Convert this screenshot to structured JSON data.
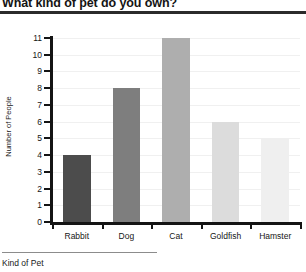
{
  "chart_data": {
    "type": "bar",
    "title": "What kind of pet do you own?",
    "xlabel": "Kind of Pet",
    "ylabel": "Number of People",
    "categories": [
      "Rabbit",
      "Dog",
      "Cat",
      "Goldfish",
      "Hamster"
    ],
    "values": [
      4,
      8,
      11,
      6,
      5
    ],
    "ylim": [
      0,
      11
    ],
    "ytick_labels": [
      "0",
      "1",
      "2",
      "3",
      "4",
      "5",
      "6",
      "7",
      "8",
      "9",
      "10",
      "11"
    ],
    "ytick_values": [
      0,
      1,
      2,
      3,
      4,
      5,
      6,
      7,
      8,
      9,
      10,
      11
    ],
    "grid": true,
    "legend": false,
    "bar_colors": [
      "#4c4c4c",
      "#7e7e7e",
      "#aeaeae",
      "#dcdcdc",
      "#efefef"
    ]
  }
}
